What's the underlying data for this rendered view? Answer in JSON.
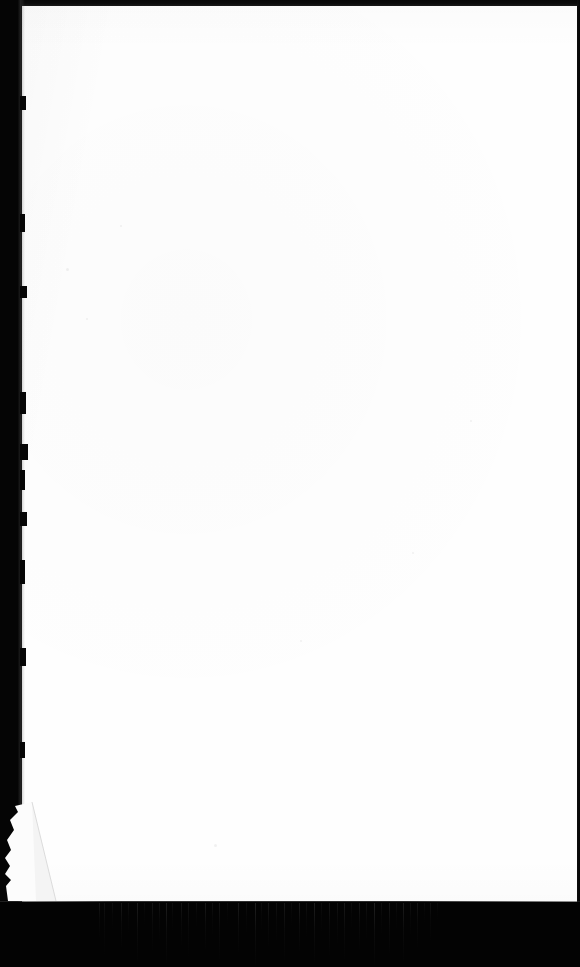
{
  "document": {
    "kind": "scanned-page",
    "page_state": "blank",
    "visible_text": "",
    "page_number": "",
    "caption": ""
  },
  "canvas": {
    "width": 580,
    "height": 967,
    "background_color": "#040404"
  },
  "paper": {
    "label": "",
    "color": "#fefefe",
    "left": 19,
    "top": 6,
    "width": 558,
    "height": 896
  },
  "edges": {
    "top": {
      "color": "#0b0b0b",
      "height": 6
    },
    "left": {
      "color": "#050505",
      "width": 22
    },
    "right": {
      "color": "#050505",
      "width": 3
    },
    "bottom": {
      "color": "#030303",
      "top": 902,
      "height": 65
    }
  },
  "artifacts": {
    "corner_tear": {
      "position": "bottom-left",
      "left": 2,
      "top": 800,
      "width": 58,
      "height": 103
    },
    "scan_streaks": {
      "region_start_x": 96,
      "region_end_x": 432,
      "top": 903,
      "count": 46
    },
    "speck_count": 7
  },
  "streak_positions": [
    {
      "x": 99,
      "h": 34,
      "o": 0.3
    },
    {
      "x": 104,
      "h": 52,
      "o": 0.22
    },
    {
      "x": 112,
      "h": 26,
      "o": 0.18
    },
    {
      "x": 121,
      "h": 44,
      "o": 0.34
    },
    {
      "x": 128,
      "h": 30,
      "o": 0.2
    },
    {
      "x": 137,
      "h": 58,
      "o": 0.4
    },
    {
      "x": 144,
      "h": 22,
      "o": 0.16
    },
    {
      "x": 152,
      "h": 48,
      "o": 0.28
    },
    {
      "x": 159,
      "h": 36,
      "o": 0.24
    },
    {
      "x": 166,
      "h": 60,
      "o": 0.44
    },
    {
      "x": 172,
      "h": 28,
      "o": 0.18
    },
    {
      "x": 181,
      "h": 42,
      "o": 0.3
    },
    {
      "x": 188,
      "h": 54,
      "o": 0.26
    },
    {
      "x": 196,
      "h": 24,
      "o": 0.2
    },
    {
      "x": 205,
      "h": 46,
      "o": 0.36
    },
    {
      "x": 212,
      "h": 32,
      "o": 0.22
    },
    {
      "x": 219,
      "h": 56,
      "o": 0.3
    },
    {
      "x": 227,
      "h": 20,
      "o": 0.15
    },
    {
      "x": 238,
      "h": 50,
      "o": 0.38
    },
    {
      "x": 246,
      "h": 30,
      "o": 0.2
    },
    {
      "x": 255,
      "h": 62,
      "o": 0.46
    },
    {
      "x": 261,
      "h": 26,
      "o": 0.18
    },
    {
      "x": 268,
      "h": 44,
      "o": 0.32
    },
    {
      "x": 276,
      "h": 38,
      "o": 0.24
    },
    {
      "x": 284,
      "h": 58,
      "o": 0.34
    },
    {
      "x": 291,
      "h": 22,
      "o": 0.16
    },
    {
      "x": 299,
      "h": 48,
      "o": 0.4
    },
    {
      "x": 306,
      "h": 34,
      "o": 0.22
    },
    {
      "x": 314,
      "h": 60,
      "o": 0.44
    },
    {
      "x": 321,
      "h": 28,
      "o": 0.18
    },
    {
      "x": 329,
      "h": 52,
      "o": 0.3
    },
    {
      "x": 337,
      "h": 40,
      "o": 0.26
    },
    {
      "x": 344,
      "h": 56,
      "o": 0.36
    },
    {
      "x": 351,
      "h": 24,
      "o": 0.17
    },
    {
      "x": 359,
      "h": 46,
      "o": 0.32
    },
    {
      "x": 366,
      "h": 36,
      "o": 0.24
    },
    {
      "x": 374,
      "h": 62,
      "o": 0.48
    },
    {
      "x": 381,
      "h": 30,
      "o": 0.2
    },
    {
      "x": 389,
      "h": 50,
      "o": 0.34
    },
    {
      "x": 396,
      "h": 26,
      "o": 0.18
    },
    {
      "x": 403,
      "h": 58,
      "o": 0.4
    },
    {
      "x": 410,
      "h": 32,
      "o": 0.22
    },
    {
      "x": 417,
      "h": 44,
      "o": 0.28
    },
    {
      "x": 424,
      "h": 20,
      "o": 0.15
    },
    {
      "x": 430,
      "h": 38,
      "o": 0.24
    },
    {
      "x": 437,
      "h": 16,
      "o": 0.12
    }
  ],
  "speck_positions": [
    {
      "x": 120,
      "y": 225,
      "s": 2
    },
    {
      "x": 66,
      "y": 268,
      "s": 3
    },
    {
      "x": 412,
      "y": 552,
      "s": 2
    },
    {
      "x": 86,
      "y": 318,
      "s": 2
    },
    {
      "x": 300,
      "y": 640,
      "s": 2
    },
    {
      "x": 214,
      "y": 844,
      "s": 3
    },
    {
      "x": 470,
      "y": 420,
      "s": 2
    }
  ],
  "edge_nicks": [
    {
      "y": 96,
      "w": 6,
      "h": 14
    },
    {
      "y": 214,
      "w": 5,
      "h": 18
    },
    {
      "y": 286,
      "w": 7,
      "h": 12
    },
    {
      "y": 392,
      "w": 6,
      "h": 22
    },
    {
      "y": 444,
      "w": 8,
      "h": 16
    },
    {
      "y": 470,
      "w": 5,
      "h": 20
    },
    {
      "y": 512,
      "w": 7,
      "h": 14
    },
    {
      "y": 560,
      "w": 5,
      "h": 24
    },
    {
      "y": 648,
      "w": 6,
      "h": 18
    },
    {
      "y": 742,
      "w": 5,
      "h": 16
    }
  ]
}
